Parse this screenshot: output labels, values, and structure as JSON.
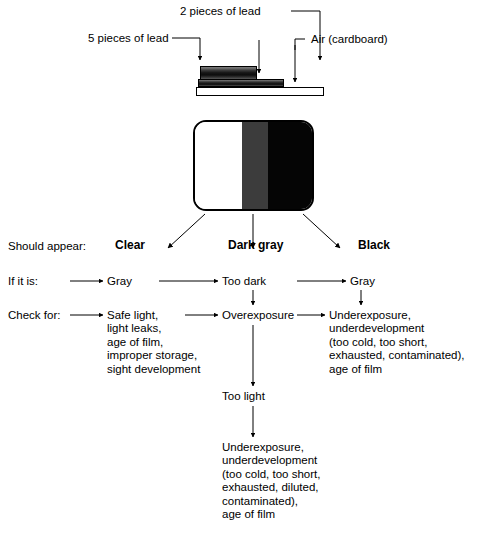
{
  "diagram": {
    "colors": {
      "clear_band": "#ffffff",
      "gray_band": "#3c3c3c",
      "black_band": "#050505",
      "line": "#000000"
    },
    "apparatus": {
      "labels": [
        {
          "id": "lead-5",
          "text": "5 pieces of lead"
        },
        {
          "id": "lead-2",
          "text": "2 pieces of lead"
        },
        {
          "id": "air",
          "text": "Air (cardboard)"
        }
      ],
      "layers": [
        {
          "id": "lead-5-block",
          "name": "five-lead-block"
        },
        {
          "id": "lead-2-block",
          "name": "two-lead-block"
        },
        {
          "id": "cardboard-base",
          "name": "cardboard-base"
        }
      ]
    },
    "film": {
      "bands": [
        {
          "id": "clear",
          "name": "clear-band"
        },
        {
          "id": "gray",
          "name": "dark-gray-band"
        },
        {
          "id": "black",
          "name": "black-band"
        }
      ]
    },
    "rows": {
      "should_appear": {
        "label": "Should appear:",
        "values": [
          "Clear",
          "Dark gray",
          "Black"
        ]
      },
      "if_it_is": {
        "label": "If it is:",
        "values": [
          "Gray",
          "Too dark",
          "Gray"
        ]
      },
      "check_for": {
        "label": "Check for:",
        "columns": [
          {
            "id": "col-1",
            "text": "Safe light,\nlight leaks,\nage of film,\nimproper storage,\nsight development"
          },
          {
            "id": "col-2",
            "text": "Overexposure"
          },
          {
            "id": "col-3",
            "text": "Underexposure,\nunderdevelopment\n(too cold, too short,\nexhausted, contaminated),\nage of film"
          }
        ]
      }
    },
    "branch": {
      "too_light": "Too light",
      "too_light_causes": "Underexposure,\nunderdevelopment\n(too cold, too short,\nexhausted, diluted,\ncontaminated),\nage of film"
    }
  }
}
